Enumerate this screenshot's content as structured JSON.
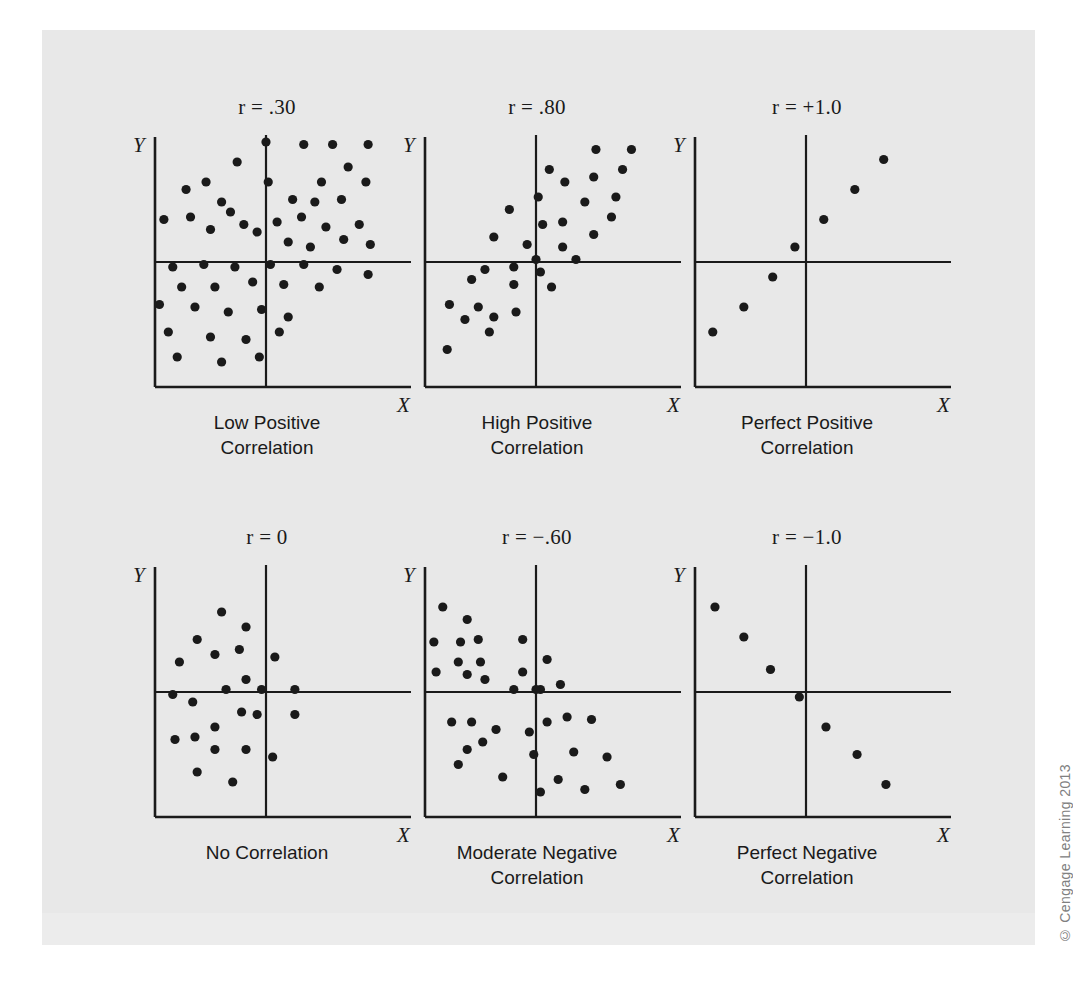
{
  "figure": {
    "background_color": "#ffffff",
    "plate_color": "#e8e8e8",
    "ink_color": "#1a1a1a",
    "copyright": "© Cengage Learning 2013"
  },
  "chart_data": [
    {
      "type": "scatter",
      "id": "low-positive",
      "title": "r = .30",
      "r_value": 0.3,
      "caption_line1": "Low Positive",
      "caption_line2": "Correlation",
      "xlabel": "X",
      "ylabel": "Y",
      "xlim": [
        0,
        100
      ],
      "ylim": [
        0,
        100
      ],
      "grid": false,
      "crosshair": [
        50,
        50
      ],
      "points": [
        [
          50,
          98
        ],
        [
          67,
          97
        ],
        [
          80,
          97
        ],
        [
          96,
          97
        ],
        [
          37,
          90
        ],
        [
          23,
          82
        ],
        [
          51,
          82
        ],
        [
          75,
          82
        ],
        [
          95,
          82
        ],
        [
          87,
          88
        ],
        [
          14,
          79
        ],
        [
          30,
          74
        ],
        [
          34,
          70
        ],
        [
          62,
          75
        ],
        [
          72,
          74
        ],
        [
          84,
          75
        ],
        [
          55,
          66
        ],
        [
          66,
          68
        ],
        [
          4,
          67
        ],
        [
          16,
          68
        ],
        [
          25,
          63
        ],
        [
          40,
          65
        ],
        [
          46,
          62
        ],
        [
          77,
          64
        ],
        [
          92,
          65
        ],
        [
          60,
          58
        ],
        [
          70,
          56
        ],
        [
          85,
          59
        ],
        [
          97,
          57
        ],
        [
          8,
          48
        ],
        [
          22,
          49
        ],
        [
          36,
          48
        ],
        [
          52,
          49
        ],
        [
          67,
          49
        ],
        [
          82,
          47
        ],
        [
          96,
          45
        ],
        [
          12,
          40
        ],
        [
          27,
          40
        ],
        [
          44,
          42
        ],
        [
          58,
          41
        ],
        [
          74,
          40
        ],
        [
          2,
          33
        ],
        [
          18,
          32
        ],
        [
          33,
          30
        ],
        [
          48,
          31
        ],
        [
          60,
          28
        ],
        [
          6,
          22
        ],
        [
          25,
          20
        ],
        [
          41,
          19
        ],
        [
          56,
          22
        ],
        [
          10,
          12
        ],
        [
          30,
          10
        ],
        [
          47,
          12
        ]
      ]
    },
    {
      "type": "scatter",
      "id": "high-positive",
      "title": "r = .80",
      "r_value": 0.8,
      "caption_line1": "High Positive",
      "caption_line2": "Correlation",
      "xlabel": "X",
      "ylabel": "Y",
      "xlim": [
        0,
        100
      ],
      "ylim": [
        0,
        100
      ],
      "grid": false,
      "crosshair": [
        50,
        50
      ],
      "points": [
        [
          77,
          95
        ],
        [
          93,
          95
        ],
        [
          56,
          87
        ],
        [
          76,
          84
        ],
        [
          89,
          87
        ],
        [
          63,
          82
        ],
        [
          51,
          76
        ],
        [
          72,
          74
        ],
        [
          86,
          76
        ],
        [
          38,
          71
        ],
        [
          62,
          66
        ],
        [
          53,
          65
        ],
        [
          84,
          68
        ],
        [
          31,
          60
        ],
        [
          76,
          61
        ],
        [
          46,
          57
        ],
        [
          62,
          56
        ],
        [
          50,
          51
        ],
        [
          68,
          51
        ],
        [
          27,
          47
        ],
        [
          40,
          48
        ],
        [
          52,
          46
        ],
        [
          21,
          43
        ],
        [
          40,
          41
        ],
        [
          57,
          40
        ],
        [
          11,
          33
        ],
        [
          24,
          32
        ],
        [
          41,
          30
        ],
        [
          18,
          27
        ],
        [
          31,
          28
        ],
        [
          29,
          22
        ],
        [
          10,
          15
        ]
      ]
    },
    {
      "type": "scatter",
      "id": "perfect-positive",
      "title": "r = +1.0",
      "r_value": 1.0,
      "caption_line1": "Perfect Positive",
      "caption_line2": "Correlation",
      "xlabel": "X",
      "ylabel": "Y",
      "xlim": [
        0,
        100
      ],
      "ylim": [
        0,
        100
      ],
      "grid": false,
      "crosshair": [
        50,
        50
      ],
      "points": [
        [
          8,
          22
        ],
        [
          22,
          32
        ],
        [
          35,
          44
        ],
        [
          45,
          56
        ],
        [
          58,
          67
        ],
        [
          72,
          79
        ],
        [
          85,
          91
        ]
      ]
    },
    {
      "type": "scatter",
      "id": "no-correlation",
      "title": "r = 0",
      "r_value": 0,
      "caption_line1": "No Correlation",
      "caption_line2": "",
      "xlabel": "X",
      "ylabel": "Y",
      "xlim": [
        0,
        100
      ],
      "ylim": [
        0,
        100
      ],
      "grid": false,
      "crosshair": [
        50,
        50
      ],
      "points": [
        [
          30,
          82
        ],
        [
          41,
          76
        ],
        [
          19,
          71
        ],
        [
          27,
          65
        ],
        [
          38,
          67
        ],
        [
          11,
          62
        ],
        [
          54,
          64
        ],
        [
          41,
          55
        ],
        [
          8,
          49
        ],
        [
          32,
          51
        ],
        [
          48,
          51
        ],
        [
          63,
          51
        ],
        [
          17,
          46
        ],
        [
          39,
          42
        ],
        [
          46,
          41
        ],
        [
          63,
          41
        ],
        [
          27,
          36
        ],
        [
          18,
          32
        ],
        [
          9,
          31
        ],
        [
          27,
          27
        ],
        [
          41,
          27
        ],
        [
          53,
          24
        ],
        [
          19,
          18
        ],
        [
          35,
          14
        ]
      ]
    },
    {
      "type": "scatter",
      "id": "moderate-negative",
      "title": "r = −.60",
      "r_value": -0.6,
      "caption_line1": "Moderate Negative",
      "caption_line2": "Correlation",
      "xlabel": "X",
      "ylabel": "Y",
      "xlim": [
        0,
        100
      ],
      "ylim": [
        0,
        100
      ],
      "grid": false,
      "crosshair": [
        50,
        50
      ],
      "points": [
        [
          8,
          84
        ],
        [
          19,
          79
        ],
        [
          4,
          70
        ],
        [
          16,
          70
        ],
        [
          24,
          71
        ],
        [
          44,
          71
        ],
        [
          15,
          62
        ],
        [
          25,
          62
        ],
        [
          55,
          63
        ],
        [
          5,
          58
        ],
        [
          19,
          57
        ],
        [
          44,
          58
        ],
        [
          27,
          55
        ],
        [
          40,
          51
        ],
        [
          52,
          51
        ],
        [
          61,
          53
        ],
        [
          50,
          51
        ],
        [
          12,
          38
        ],
        [
          21,
          38
        ],
        [
          55,
          38
        ],
        [
          64,
          40
        ],
        [
          75,
          39
        ],
        [
          32,
          35
        ],
        [
          47,
          34
        ],
        [
          26,
          30
        ],
        [
          19,
          27
        ],
        [
          49,
          25
        ],
        [
          67,
          26
        ],
        [
          82,
          24
        ],
        [
          15,
          21
        ],
        [
          35,
          16
        ],
        [
          60,
          15
        ],
        [
          52,
          10
        ],
        [
          72,
          11
        ],
        [
          88,
          13
        ]
      ]
    },
    {
      "type": "scatter",
      "id": "perfect-negative",
      "title": "r = −1.0",
      "r_value": -1.0,
      "caption_line1": "Perfect Negative",
      "caption_line2": "Correlation",
      "xlabel": "X",
      "ylabel": "Y",
      "xlim": [
        0,
        100
      ],
      "ylim": [
        0,
        100
      ],
      "grid": false,
      "crosshair": [
        50,
        50
      ],
      "points": [
        [
          9,
          84
        ],
        [
          22,
          72
        ],
        [
          34,
          59
        ],
        [
          47,
          48
        ],
        [
          59,
          36
        ],
        [
          73,
          25
        ],
        [
          86,
          13
        ]
      ]
    }
  ]
}
